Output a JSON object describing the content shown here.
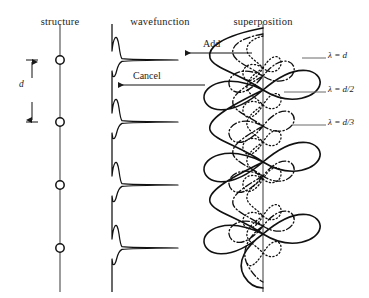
{
  "figure": {
    "type": "physics-diagram",
    "background_color": "#ffffff",
    "ink_color": "#1a1a1a"
  },
  "columns": [
    {
      "id": "structure",
      "label": "structure",
      "x": 60,
      "header_x": 60
    },
    {
      "id": "wavefunction",
      "label": "wavefunction",
      "x": 112,
      "header_x": 160
    },
    {
      "id": "superposition",
      "label": "superposition",
      "x": 263,
      "header_x": 263
    }
  ],
  "structure": {
    "axis": {
      "x": 60,
      "y_top": 24,
      "y_bottom": 292
    },
    "atom_radius": 4.2,
    "atoms_y": [
      60,
      122,
      185,
      248
    ],
    "spacing_label": "d",
    "spacing_label_x": 22,
    "spacing_label_y": 85,
    "dimension_arrow": {
      "x": 32,
      "y_top": 60,
      "y_bottom": 122
    }
  },
  "wavefunction": {
    "baseline_x": 112,
    "peak_extent_x": 178,
    "peaks_y": [
      60,
      122,
      185,
      248
    ],
    "peak_half_width": 9
  },
  "superposition": {
    "axis_x": 263,
    "axis_y_top": 24,
    "axis_y_bottom": 292,
    "wave_top": 28,
    "wave_bottom": 288,
    "waves": [
      {
        "id": "lambda-d",
        "style": "solid",
        "wavelength": 124,
        "amplitude": 56,
        "label": "λ = d",
        "label_x": 330,
        "label_y": 58,
        "leader_from_x": 302,
        "leader_to_x": 326
      },
      {
        "id": "lambda-d-2",
        "style": "dashdot",
        "wavelength": 62,
        "amplitude": 36,
        "label": "λ = d/2",
        "label_x": 330,
        "label_y": 92,
        "leader_from_x": 296,
        "leader_to_x": 326
      },
      {
        "id": "lambda-d-3",
        "style": "dotted",
        "wavelength": 41,
        "amplitude": 20,
        "label": "λ = d/3",
        "label_x": 330,
        "label_y": 125,
        "leader_from_x": 296,
        "leader_to_x": 326
      }
    ]
  },
  "annotations": [
    {
      "id": "add",
      "label": "Add",
      "text_x": 205,
      "text_y": 47,
      "arrow_y": 53,
      "arrow_from_x": 252,
      "arrow_to_x": 185
    },
    {
      "id": "cancel",
      "label": "Cancel",
      "text_x": 135,
      "text_y": 76,
      "arrow_y": 85,
      "arrow_from_x": 205,
      "arrow_to_x": 118
    }
  ]
}
